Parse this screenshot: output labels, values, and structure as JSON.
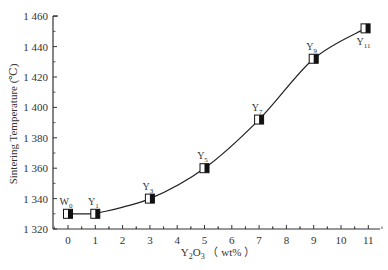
{
  "chart_data": {
    "type": "line",
    "title": "",
    "xlabel": "Y2O3 (wt%)",
    "xlabel_parts": {
      "base": "Y",
      "sub1": "2",
      "mid": "O",
      "sub2": "3",
      "unit": "（ wt% ）"
    },
    "ylabel": "Sintering Temperature (℃)",
    "xlim": [
      -0.55,
      11.55
    ],
    "ylim": [
      1320,
      1460
    ],
    "x_ticks": [
      0,
      1,
      2,
      3,
      4,
      5,
      6,
      7,
      8,
      9,
      10,
      11
    ],
    "x_tick_labels": [
      "0",
      "1",
      "2",
      "3",
      "4",
      "5",
      "6",
      "7",
      "8",
      "9",
      "10",
      "11"
    ],
    "y_ticks": [
      1320,
      1340,
      1360,
      1380,
      1400,
      1420,
      1440,
      1460
    ],
    "y_tick_labels": [
      "1 320",
      "1 340",
      "1 360",
      "1 380",
      "1 400",
      "1 420",
      "1 440",
      "1 460"
    ],
    "grid": false,
    "legend": null,
    "series": [
      {
        "name": "Sintering Temperature",
        "marker": "half-filled square",
        "points": [
          {
            "label": "W",
            "sub": "0",
            "x": 0,
            "y": 1330
          },
          {
            "label": "Y",
            "sub": "1",
            "x": 1,
            "y": 1330
          },
          {
            "label": "Y",
            "sub": "3",
            "x": 3,
            "y": 1340
          },
          {
            "label": "Y",
            "sub": "5",
            "x": 5,
            "y": 1360
          },
          {
            "label": "Y",
            "sub": "7",
            "x": 7,
            "y": 1392
          },
          {
            "label": "Y",
            "sub": "9",
            "x": 9,
            "y": 1432
          },
          {
            "label": "Y",
            "sub": "11",
            "x": 10.9,
            "y": 1452
          }
        ]
      }
    ]
  },
  "colors": {
    "line": "#222222",
    "axis": "#333333",
    "marker_fill": "#ffffff",
    "marker_dark": "#111111"
  }
}
